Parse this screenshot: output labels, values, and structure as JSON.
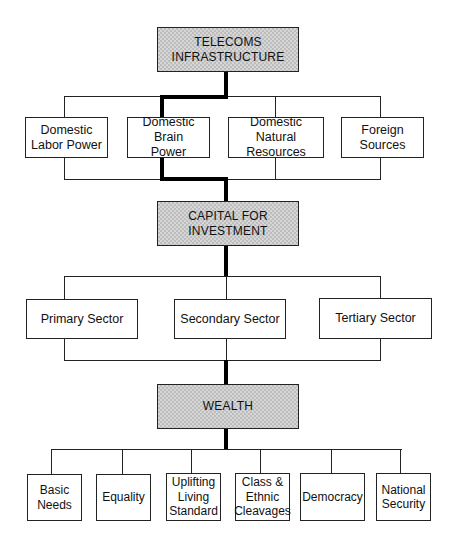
{
  "diagram": {
    "type": "flowchart",
    "levels": [
      {
        "id": "telecoms",
        "label": "TELECOMS\nINFRASTRUCTURE",
        "shaded": true
      },
      {
        "id": "inputs",
        "items": [
          {
            "label": "Domestic\nLabor Power"
          },
          {
            "label": "Domestic Brain\nPower"
          },
          {
            "label": "Domestic Natural\nResources"
          },
          {
            "label": "Foreign\nSources"
          }
        ]
      },
      {
        "id": "capital",
        "label": "CAPITAL FOR\nINVESTMENT",
        "shaded": true
      },
      {
        "id": "sectors",
        "items": [
          {
            "label": "Primary Sector"
          },
          {
            "label": "Secondary Sector"
          },
          {
            "label": "Tertiary Sector"
          }
        ]
      },
      {
        "id": "wealth",
        "label": "WEALTH",
        "shaded": true
      },
      {
        "id": "outcomes",
        "items": [
          {
            "label": "Basic\nNeeds"
          },
          {
            "label": "Equality"
          },
          {
            "label": "Uplifting\nLiving\nStandard"
          },
          {
            "label": "Class &\nEthnic\nCleavages"
          },
          {
            "label": "Democracy"
          },
          {
            "label": "National\nSecurity"
          }
        ]
      }
    ],
    "highlighted_path": [
      "TELECOMS INFRASTRUCTURE",
      "Domestic Brain Power",
      "CAPITAL FOR INVESTMENT",
      "WEALTH"
    ],
    "colors": {
      "line": "#222222",
      "highlight_line": "#000000",
      "shaded_fill": "#d0d0d0",
      "box_fill": "#ffffff"
    }
  }
}
